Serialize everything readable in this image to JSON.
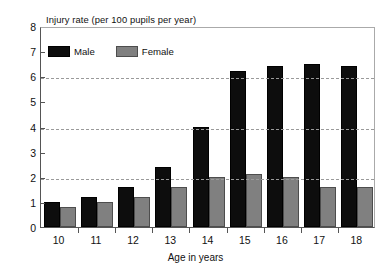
{
  "chart_data": {
    "type": "bar",
    "title": "Injury rate (per 100 pupils per year)",
    "xlabel": "Age in years",
    "ylabel": "",
    "categories": [
      "10",
      "11",
      "12",
      "13",
      "14",
      "15",
      "16",
      "17",
      "18"
    ],
    "series": [
      {
        "name": "Male",
        "color": "#0d0d0d",
        "values": [
          1.0,
          1.2,
          1.6,
          2.4,
          4.0,
          6.2,
          6.4,
          6.5,
          6.4
        ]
      },
      {
        "name": "Female",
        "color": "#808080",
        "values": [
          0.8,
          1.0,
          1.2,
          1.6,
          2.0,
          2.1,
          2.0,
          1.6,
          1.6
        ]
      }
    ],
    "ylim": [
      0,
      8
    ],
    "y_ticks": [
      "0",
      "1",
      "2",
      "3",
      "4",
      "5",
      "6",
      "7",
      "8"
    ],
    "gridlines_at": [
      2,
      4,
      6
    ],
    "grid": true,
    "legend_position": "top-left-inside"
  }
}
